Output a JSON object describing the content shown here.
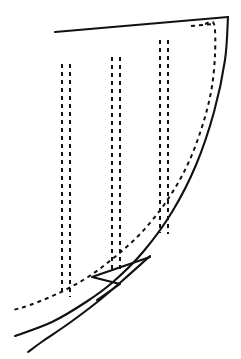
{
  "figure": {
    "domain": "technical-line-drawing",
    "canvas": {
      "width": 241,
      "height": 359
    },
    "background_color": "#ffffff",
    "ink_color": "#111111",
    "line_styles": {
      "visible_edge": {
        "kind": "solid",
        "width": 2.1
      },
      "hidden_edge": {
        "kind": "dashed",
        "width": 2.0,
        "dash": "4 4"
      }
    },
    "geometry": {
      "top_edge": {
        "name": "top-straight-edge",
        "style": "solid",
        "points": [
          [
            55,
            32
          ],
          [
            228,
            17
          ]
        ]
      },
      "right_edge": {
        "name": "right-trailing-curve",
        "style": "solid",
        "points": [
          [
            228,
            17
          ],
          [
            225,
            60
          ],
          [
            214,
            112
          ],
          [
            196,
            165
          ],
          [
            172,
            212
          ],
          [
            143,
            252
          ],
          [
            113,
            282
          ],
          [
            86,
            302
          ],
          [
            52,
            322
          ],
          [
            15,
            336
          ]
        ]
      },
      "lower_outer_edge": {
        "name": "lower-outer-curve",
        "style": "solid",
        "points": [
          [
            150,
            256
          ],
          [
            122,
            281
          ],
          [
            96,
            303
          ],
          [
            68,
            324
          ],
          [
            43,
            341
          ],
          [
            28,
            352
          ]
        ]
      },
      "leading_notch": {
        "name": "leading-edge-notch",
        "style": "solid",
        "points": [
          [
            150,
            257
          ],
          [
            92,
            277
          ],
          [
            120,
            284
          ],
          [
            97,
            300
          ]
        ]
      },
      "hidden_right_curve": {
        "name": "hidden-right-curve",
        "style": "dashed",
        "points": [
          [
            205,
            24
          ],
          [
            214,
            24
          ],
          [
            215,
            55
          ],
          [
            211,
            92
          ],
          [
            201,
            130
          ],
          [
            186,
            168
          ],
          [
            166,
            202
          ],
          [
            142,
            232
          ],
          [
            116,
            256
          ],
          [
            88,
            277
          ],
          [
            59,
            293
          ],
          [
            30,
            305
          ],
          [
            13,
            310
          ]
        ]
      },
      "hidden_top_tick": {
        "name": "hidden-top-tick",
        "style": "dashed",
        "points": [
          [
            191,
            26
          ],
          [
            214,
            24
          ]
        ]
      },
      "ribs": [
        {
          "name": "rib-1",
          "style": "dashed",
          "left_line": [
            [
              62,
              64
            ],
            [
              62,
              296
            ]
          ],
          "right_line": [
            [
              70,
              64
            ],
            [
              70,
              297
            ]
          ]
        },
        {
          "name": "rib-2",
          "style": "dashed",
          "left_line": [
            [
              112,
              57
            ],
            [
              112,
              272
            ]
          ],
          "right_line": [
            [
              120,
              57
            ],
            [
              120,
              273
            ]
          ]
        },
        {
          "name": "rib-3",
          "style": "dashed",
          "left_line": [
            [
              160,
              40
            ],
            [
              160,
              233
            ]
          ],
          "right_line": [
            [
              168,
              40
            ],
            [
              168,
              234
            ]
          ]
        }
      ]
    }
  }
}
